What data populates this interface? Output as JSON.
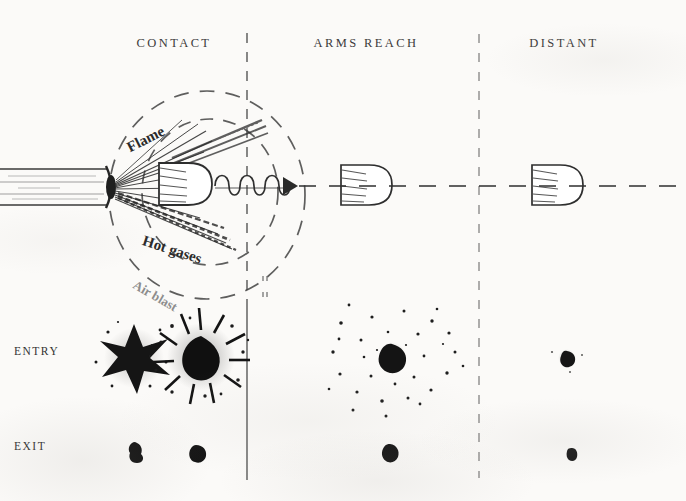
{
  "figure": {
    "background_color": "#fbfaf8",
    "ink_color": "#2a2a2a"
  },
  "columns": [
    {
      "id": "contact",
      "label": "CONTACT",
      "center_x": 174,
      "header_y": 43
    },
    {
      "id": "arms-reach",
      "label": "ARMS REACH",
      "center_x": 366,
      "header_y": 43
    },
    {
      "id": "distant",
      "label": "DISTANT",
      "center_x": 564,
      "header_y": 43
    }
  ],
  "dividers": [
    {
      "id": "divider-1",
      "x": 247,
      "style": "dashed-top-solid-bottom"
    },
    {
      "id": "divider-2",
      "x": 479,
      "style": "dashed"
    }
  ],
  "rows": [
    {
      "id": "entry",
      "label": "ENTRY",
      "label_x": 14,
      "label_y": 352
    },
    {
      "id": "exit",
      "label": "EXIT",
      "label_x": 14,
      "label_y": 446
    }
  ],
  "callouts": [
    {
      "id": "flame",
      "text": "Flame",
      "x": 128,
      "y": 150,
      "rotation": -27
    },
    {
      "id": "hot-gases",
      "text": "Hot gases",
      "x": 143,
      "y": 240,
      "rotation": 18
    },
    {
      "id": "air-blast",
      "text": "Air blast",
      "x": 134,
      "y": 283,
      "rotation": 30
    }
  ],
  "diagram": {
    "trajectory_label": "bullet trajectory",
    "muzzle_blast_zones": [
      "inner dashed ellipse",
      "outer dashed ellipse"
    ],
    "smoke_trail": "coiled spiral with arrowhead",
    "bullets": [
      {
        "id": "bullet-contact",
        "cx": 197,
        "cy": 183
      },
      {
        "id": "bullet-arms-reach",
        "cx": 367,
        "cy": 185
      },
      {
        "id": "bullet-distant",
        "cx": 557,
        "cy": 185
      }
    ]
  },
  "wounds": {
    "entry": [
      {
        "id": "entry-contact-stellate",
        "column": "contact",
        "type": "stellate tear",
        "cx": 134,
        "cy": 358
      },
      {
        "id": "entry-contact-sooted",
        "column": "contact",
        "type": "round hole with soot blackening",
        "cx": 201,
        "cy": 357
      },
      {
        "id": "entry-arms-reach",
        "column": "arms-reach",
        "type": "hole with powder stippling",
        "cx": 392,
        "cy": 356
      },
      {
        "id": "entry-distant",
        "column": "distant",
        "type": "plain round hole",
        "cx": 567,
        "cy": 358
      }
    ],
    "exit": [
      {
        "id": "exit-contact-1",
        "column": "contact",
        "type": "small irregular hole",
        "cx": 135,
        "cy": 451
      },
      {
        "id": "exit-contact-2",
        "column": "contact",
        "type": "small round hole",
        "cx": 196,
        "cy": 452
      },
      {
        "id": "exit-arms-reach",
        "column": "arms-reach",
        "type": "small round hole",
        "cx": 390,
        "cy": 453
      },
      {
        "id": "exit-distant",
        "column": "distant",
        "type": "small round hole",
        "cx": 572,
        "cy": 454
      }
    ]
  }
}
